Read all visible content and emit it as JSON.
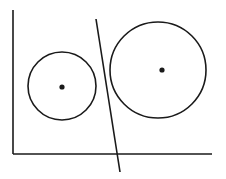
{
  "diagram": {
    "background": "#ffffff",
    "stroke_color": "#1a1a1a",
    "vertical_axis": {
      "x1": 13,
      "y1": 10,
      "x2": 13,
      "y2": 154
    },
    "horizontal_axis": {
      "x1": 13,
      "y1": 154,
      "x2": 212,
      "y2": 154
    },
    "diagonal_line": {
      "x1": 96,
      "y1": 19,
      "x2": 120,
      "y2": 172
    },
    "small_circle": {
      "cx": 62,
      "cy": 86,
      "r": 34,
      "center_dot": {
        "cx": 62,
        "cy": 87,
        "r": 2.6
      }
    },
    "large_circle": {
      "cx": 158,
      "cy": 70,
      "r": 48,
      "center_dot": {
        "cx": 162,
        "cy": 70,
        "r": 2.6
      }
    }
  }
}
